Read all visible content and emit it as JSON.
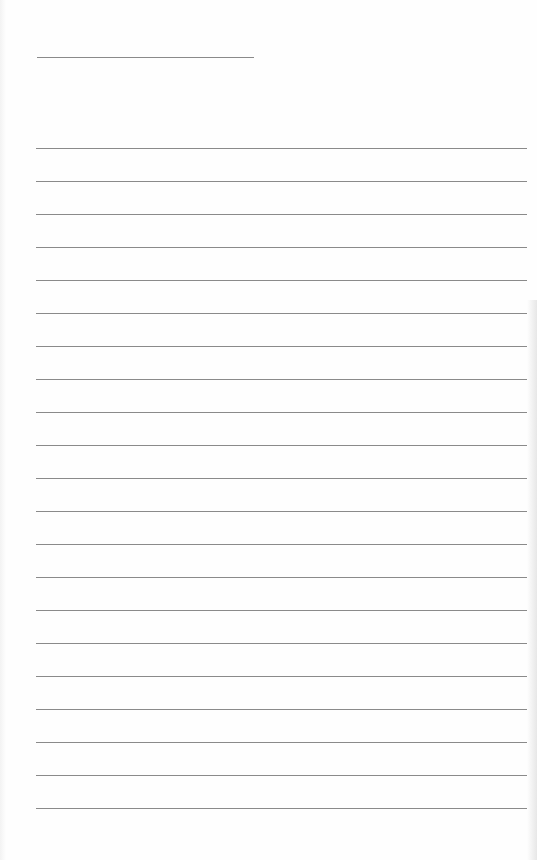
{
  "page": {
    "type": "lined-paper",
    "header_line": {
      "text": ""
    },
    "ruled_lines": {
      "count": 21,
      "first_top_px": 148,
      "spacing_px": 33,
      "entries": [
        "",
        "",
        "",
        "",
        "",
        "",
        "",
        "",
        "",
        "",
        "",
        "",
        "",
        "",
        "",
        "",
        "",
        "",
        "",
        "",
        ""
      ]
    },
    "colors": {
      "paper": "#fefefe",
      "line": "#8a8a8a"
    }
  }
}
